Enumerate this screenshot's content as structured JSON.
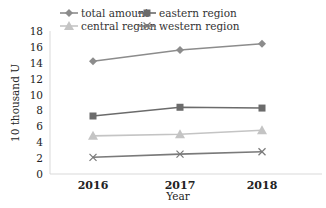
{
  "chart_data": {
    "type": "line",
    "title": "",
    "xlabel": "Year",
    "ylabel": "10 thousand U",
    "categories": [
      "2016",
      "2017",
      "2018"
    ],
    "ylim": [
      0,
      18
    ],
    "yticks": [
      0,
      2,
      4,
      6,
      8,
      10,
      12,
      14,
      16,
      18
    ],
    "grid": false,
    "legend_position": "top",
    "series": [
      {
        "name": "total amount",
        "values": [
          14.2,
          15.6,
          16.4
        ],
        "color": "#8c8c8c",
        "marker": "diamond"
      },
      {
        "name": "eastern region",
        "values": [
          7.3,
          8.4,
          8.3
        ],
        "color": "#6b6b6b",
        "marker": "square"
      },
      {
        "name": "central region",
        "values": [
          4.8,
          5.0,
          5.5
        ],
        "color": "#c4c4c4",
        "marker": "triangle"
      },
      {
        "name": "western region",
        "values": [
          2.1,
          2.5,
          2.8
        ],
        "color": "#7a7a7a",
        "marker": "x"
      }
    ]
  }
}
